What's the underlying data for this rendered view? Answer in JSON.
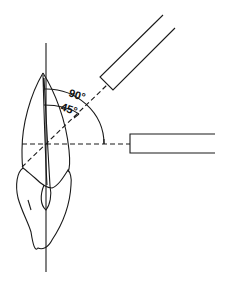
{
  "diagram": {
    "type": "dental radiograph bisecting-angle / paralleling illustration",
    "labels": {
      "angle_large": "90°",
      "angle_small": "45°"
    },
    "elements": [
      "long-axis-line",
      "tooth-outline",
      "horizontal-central-ray",
      "angled-central-ray",
      "horizontal-cone",
      "angled-cone",
      "arc-90",
      "arc-45"
    ],
    "colors": {
      "line": "#1a1a1a",
      "background": "#ffffff"
    }
  }
}
